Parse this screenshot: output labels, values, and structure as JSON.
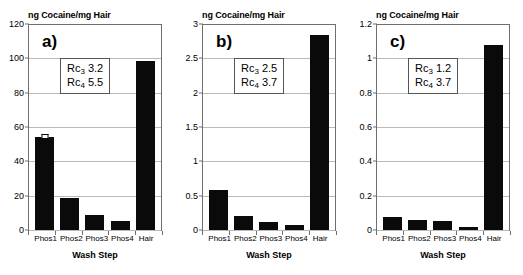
{
  "figure": {
    "shared": {
      "ylabel": "ng Cocaine/mg Hair",
      "xlabel": "Wash Step",
      "categories": [
        "Phos1",
        "Phos2",
        "Phos3",
        "Phos4",
        "Hair"
      ],
      "bar_color": "#0a0a0a",
      "grid_color": "#b9b9b9",
      "axis_color": "#6f6f6f"
    },
    "panels": [
      {
        "letter": "a)",
        "ylim": [
          0,
          120
        ],
        "yticks": [
          "0",
          "20",
          "40",
          "60",
          "80",
          "100",
          "120"
        ],
        "values": [
          54,
          18.8,
          8.5,
          5.4,
          98.5
        ],
        "error_bar_index": 0,
        "annotation": {
          "line1_label": "Rc",
          "line1_sub": "3",
          "line1_value": "3.2",
          "line2_label": "Rc",
          "line2_sub": "4",
          "line2_value": "5.5"
        }
      },
      {
        "letter": "b)",
        "ylim": [
          0,
          3
        ],
        "yticks": [
          "0",
          "0.5",
          "1",
          "1.5",
          "2",
          "2.5",
          "3"
        ],
        "values": [
          0.59,
          0.21,
          0.12,
          0.08,
          2.84
        ],
        "error_bar_index": -1,
        "annotation": {
          "line1_label": "Rc",
          "line1_sub": "3",
          "line1_value": "2.5",
          "line2_label": "Rc",
          "line2_sub": "4",
          "line2_value": "3.7"
        }
      },
      {
        "letter": "c)",
        "ylim": [
          0,
          1.2
        ],
        "yticks": [
          "0",
          "0.2",
          "0.4",
          "0.6",
          "0.8",
          "1",
          "1.2"
        ],
        "values": [
          0.075,
          0.06,
          0.05,
          0.02,
          1.08
        ],
        "error_bar_index": -1,
        "annotation": {
          "line1_label": "Rc",
          "line1_sub": "3",
          "line1_value": "1.2",
          "line2_label": "Rc",
          "line2_sub": "4",
          "line2_value": "3.7"
        }
      }
    ]
  },
  "chart_data": [
    {
      "type": "bar",
      "title": "a)",
      "categories": [
        "Phos1",
        "Phos2",
        "Phos3",
        "Phos4",
        "Hair"
      ],
      "values": [
        54,
        18.8,
        8.5,
        5.4,
        98.5
      ],
      "xlabel": "Wash Step",
      "ylabel": "ng Cocaine/mg Hair",
      "ylim": [
        0,
        120
      ],
      "yticks": [
        0,
        20,
        40,
        60,
        80,
        100,
        120
      ],
      "grid": true,
      "legend": "none",
      "annotations": [
        "Rc3 3.2",
        "Rc4 5.5"
      ]
    },
    {
      "type": "bar",
      "title": "b)",
      "categories": [
        "Phos1",
        "Phos2",
        "Phos3",
        "Phos4",
        "Hair"
      ],
      "values": [
        0.59,
        0.21,
        0.12,
        0.08,
        2.84
      ],
      "xlabel": "Wash Step",
      "ylabel": "ng Cocaine/mg Hair",
      "ylim": [
        0,
        3
      ],
      "yticks": [
        0,
        0.5,
        1,
        1.5,
        2,
        2.5,
        3
      ],
      "grid": true,
      "legend": "none",
      "annotations": [
        "Rc3 2.5",
        "Rc4 3.7"
      ]
    },
    {
      "type": "bar",
      "title": "c)",
      "categories": [
        "Phos1",
        "Phos2",
        "Phos3",
        "Phos4",
        "Hair"
      ],
      "values": [
        0.075,
        0.06,
        0.05,
        0.02,
        1.08
      ],
      "xlabel": "Wash Step",
      "ylabel": "ng Cocaine/mg Hair",
      "ylim": [
        0,
        1.2
      ],
      "yticks": [
        0,
        0.2,
        0.4,
        0.6,
        0.8,
        1,
        1.2
      ],
      "grid": true,
      "legend": "none",
      "annotations": [
        "Rc3 1.2",
        "Rc4 3.7"
      ]
    }
  ]
}
